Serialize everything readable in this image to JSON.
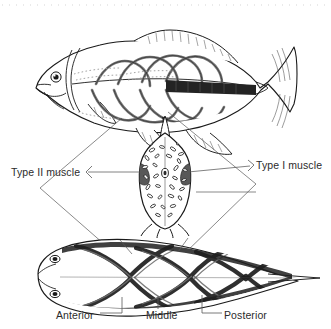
{
  "figure": {
    "domain": "diagram",
    "background_color": "#ffffff",
    "ink_color": "#1a1a1a",
    "text_color": "#2b2b2b",
    "width": 331,
    "height": 329
  },
  "labels": {
    "type_ii_muscle": "Type II muscle",
    "type_i_muscle": "Type I muscle",
    "anterior": "Anterior",
    "middle": "Middle",
    "posterior": "Posterior"
  },
  "panels": {
    "top": {
      "name": "lateral-fish-view",
      "description": "Lateral view of fish showing internal myomere muscle bands and a dark shaded Type I muscle band along the midline toward the caudal peduncle"
    },
    "middle": {
      "name": "body-cross-section",
      "description": "Transverse cross-section of fish trunk; dark lateral wedges are Type I (red) muscle, speckled interior is Type II (white) muscle"
    },
    "bottom": {
      "name": "dorsal-fish-view",
      "description": "Dorsal view of fish showing chevron myomere bands at anterior, middle and posterior body positions"
    }
  },
  "leaders": {
    "type_ii_points_to": "cross-section interior speckled region",
    "type_i_points_to": "cross-section dark lateral wedge",
    "anterior_points_to": "anterior myomere band of dorsal view",
    "middle_points_to": "middle myomere band of dorsal view",
    "posterior_points_to": "posterior myomere band of dorsal view"
  },
  "colors": {
    "ink": "#1a1a1a",
    "mid_gray": "#6f6f6f",
    "light_gray": "#b9b9b9",
    "dark_fill": "#2a2a2a",
    "white": "#ffffff"
  }
}
